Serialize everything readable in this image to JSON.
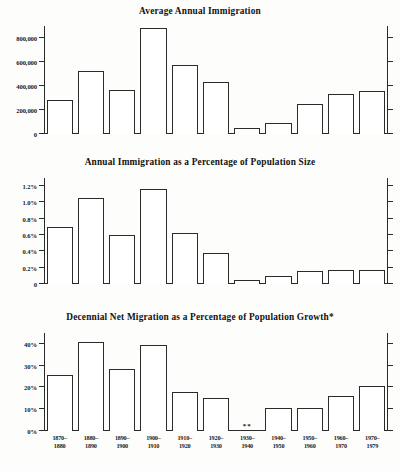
{
  "figure": {
    "footnote_fragment": " "
  },
  "chart_data": [
    {
      "type": "bar",
      "title": "Average Annual Immigration",
      "xlabel": "",
      "ylabel": "",
      "ylim": [
        0,
        900000
      ],
      "grid": false,
      "legend": "none",
      "ytick_labels": [
        "0",
        "200,000",
        "400,000",
        "600,000",
        "800,000"
      ],
      "ytick_values": [
        0,
        200000,
        400000,
        600000,
        800000
      ],
      "categories": [
        "1870-1880",
        "1880-1890",
        "1890-1900",
        "1900-1910",
        "1910-1920",
        "1920-1930",
        "1930-1940",
        "1940-1950",
        "1950-1960",
        "1960-1970",
        "1970-1979"
      ],
      "values": [
        281000,
        525000,
        370000,
        880000,
        575000,
        430000,
        50000,
        95000,
        250000,
        330000,
        360000
      ]
    },
    {
      "type": "bar",
      "title": "Annual Immigration as a Percentage of Population Size",
      "xlabel": "",
      "ylabel": "",
      "ylim": [
        0,
        1.3
      ],
      "grid": false,
      "legend": "none",
      "ytick_labels": [
        "0",
        "0.2%",
        "0.4%",
        "0.6%",
        "0.8%",
        "1.0%",
        "1.2%"
      ],
      "ytick_values": [
        0,
        0.2,
        0.4,
        0.6,
        0.8,
        1.0,
        1.2
      ],
      "categories": [
        "1870-1880",
        "1880-1890",
        "1890-1900",
        "1900-1910",
        "1910-1920",
        "1920-1930",
        "1930-1940",
        "1940-1950",
        "1950-1960",
        "1960-1970",
        "1970-1979"
      ],
      "values": [
        0.7,
        1.05,
        0.6,
        1.16,
        0.62,
        0.38,
        0.05,
        0.1,
        0.16,
        0.17,
        0.17
      ]
    },
    {
      "type": "bar",
      "title": "Decennial Net Migration as a Percentage of Population Growth*",
      "xlabel": "",
      "ylabel": "",
      "ylim": [
        0,
        45
      ],
      "grid": false,
      "legend": "none",
      "ytick_labels": [
        "0%",
        "10%",
        "20%",
        "30%",
        "40%"
      ],
      "ytick_values": [
        0,
        10,
        20,
        30,
        40
      ],
      "categories": [
        "1870-1880",
        "1880-1890",
        "1890-1900",
        "1900-1910",
        "1910-1920",
        "1920-1930",
        "1930-1940",
        "1940-1950",
        "1950-1960",
        "1960-1970",
        "1970-1979"
      ],
      "values": [
        25.5,
        41.0,
        28.5,
        39.5,
        18.0,
        15.0,
        null,
        10.5,
        10.5,
        16.0,
        20.5
      ],
      "annotations": [
        {
          "category": "1930-1940",
          "text": "**"
        }
      ]
    }
  ],
  "xaxis": {
    "labels": [
      {
        "top": "1870–",
        "bottom": "1880"
      },
      {
        "top": "1880–",
        "bottom": "1890"
      },
      {
        "top": "1890–",
        "bottom": "1900"
      },
      {
        "top": "1900–",
        "bottom": "1910"
      },
      {
        "top": "1910–",
        "bottom": "1920"
      },
      {
        "top": "1920–",
        "bottom": "1930"
      },
      {
        "top": "1930–",
        "bottom": "1940"
      },
      {
        "top": "1940–",
        "bottom": "1950"
      },
      {
        "top": "1950–",
        "bottom": "1960"
      },
      {
        "top": "1960–",
        "bottom": "1970"
      },
      {
        "top": "1970–",
        "bottom": "1979"
      }
    ]
  }
}
